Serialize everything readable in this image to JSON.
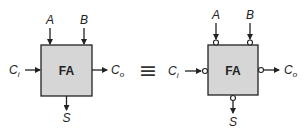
{
  "diagram": {
    "left_block": {
      "label": "FA",
      "inputs": {
        "top_left": "A",
        "top_right": "B",
        "left": "C",
        "left_sub": "i"
      },
      "outputs": {
        "right": "C",
        "right_sub": "o",
        "bottom": "S"
      },
      "bubbles": false
    },
    "equivalence_symbol": "≡",
    "right_block": {
      "label": "FA",
      "inputs": {
        "top_left": "A",
        "top_right": "B",
        "left": "C",
        "left_sub": "i"
      },
      "outputs": {
        "right": "C",
        "right_sub": "o",
        "bottom": "S"
      },
      "bubbles": true
    },
    "colors": {
      "box_fill": "#d6d6d6",
      "stroke": "#222222"
    }
  }
}
